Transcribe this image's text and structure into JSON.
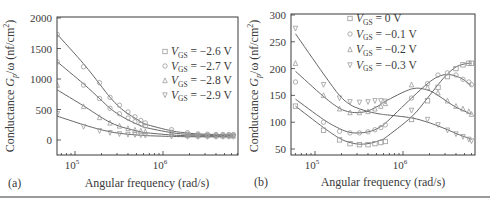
{
  "chart_data": [
    {
      "panel": "(a)",
      "type": "scatter",
      "title": "",
      "xlabel": "Angular frequency (rad/s)",
      "ylabel": "Conductance Gp/ω (nF/cm²)",
      "xscale": "log",
      "xlim": [
        63000,
        7000000
      ],
      "ylim": [
        -250,
        2000
      ],
      "xticks": [
        "10^5",
        "10^6"
      ],
      "yticks": [
        0,
        500,
        1000,
        1500,
        2000
      ],
      "legend": [
        "VGS = −2.6 V",
        "VGS = −2.7 V",
        "VGS = −2.8 V",
        "VGS = −2.9 V"
      ],
      "legend_position": "upper right",
      "grid": false,
      "series": [
        {
          "name": "VGS = −2.6 V",
          "marker": "circle",
          "x": [
            63000,
            125000,
            190000,
            250000,
            320000,
            400000,
            480000,
            560000,
            630000,
            1250000,
            1900000,
            2500000,
            3200000,
            4000000,
            4800000,
            5600000,
            6300000
          ],
          "y": [
            1730,
            1200,
            940,
            700,
            570,
            460,
            380,
            320,
            280,
            170,
            120,
            100,
            95,
            90,
            90,
            90,
            90
          ],
          "fit_y": [
            1730,
            1250,
            920,
            700,
            540,
            430,
            360,
            300,
            260,
            150,
            115,
            100,
            95,
            90,
            88,
            88,
            88
          ]
        },
        {
          "name": "VGS = −2.7 V",
          "marker": "circle",
          "x": [
            63000,
            125000,
            190000,
            250000,
            320000,
            400000,
            480000,
            560000,
            630000,
            1250000,
            1900000,
            2500000,
            3200000,
            4000000,
            4800000,
            5600000,
            6300000
          ],
          "y": [
            1280,
            900,
            680,
            520,
            430,
            360,
            300,
            260,
            230,
            130,
            95,
            85,
            80,
            80,
            80,
            80,
            80
          ],
          "fit_y": [
            1280,
            920,
            680,
            520,
            410,
            330,
            275,
            235,
            205,
            120,
            92,
            82,
            78,
            76,
            75,
            75,
            75
          ]
        },
        {
          "name": "VGS = −2.8 V",
          "marker": "triangle-up",
          "x": [
            63000,
            125000,
            190000,
            250000,
            320000,
            400000,
            480000,
            560000,
            630000,
            1250000,
            1900000,
            2500000,
            3200000,
            4000000,
            4800000,
            5600000,
            6300000
          ],
          "y": [
            900,
            550,
            370,
            280,
            230,
            190,
            165,
            150,
            135,
            90,
            75,
            70,
            70,
            68,
            68,
            68,
            68
          ],
          "fit_y": [
            820,
            560,
            390,
            290,
            225,
            185,
            155,
            135,
            120,
            82,
            70,
            66,
            65,
            64,
            64,
            64,
            64
          ]
        },
        {
          "name": "VGS = −2.9 V",
          "marker": "triangle-down",
          "x": [
            63000,
            125000,
            190000,
            250000,
            320000,
            400000,
            480000,
            560000,
            630000,
            1250000,
            1900000,
            2500000,
            3200000,
            4000000,
            4800000,
            5600000,
            6300000
          ],
          "y": [
            430,
            220,
            150,
            120,
            100,
            90,
            85,
            80,
            75,
            60,
            55,
            55,
            55,
            55,
            55,
            55,
            55
          ],
          "fit_y": [
            390,
            250,
            175,
            135,
            110,
            95,
            85,
            78,
            72,
            58,
            54,
            53,
            52,
            52,
            52,
            52,
            52
          ]
        }
      ]
    },
    {
      "panel": "(b)",
      "type": "scatter",
      "title": "",
      "xlabel": "Angular frequency (rad/s)",
      "ylabel": "Conductance Gp/ω (nF/cm²)",
      "xscale": "log",
      "xlim": [
        54000,
        6600000
      ],
      "ylim": [
        45,
        300
      ],
      "xticks": [
        "10^5",
        "10^6"
      ],
      "yticks": [
        50,
        100,
        150,
        200,
        250,
        300
      ],
      "legend": [
        "VGS = 0 V",
        "VGS = −0.1 V",
        "VGS = −0.2 V",
        "VGS = −0.3 V"
      ],
      "legend_position": "upper center",
      "grid": false,
      "series": [
        {
          "name": "VGS = 0 V",
          "marker": "square",
          "x": [
            60000,
            125000,
            190000,
            250000,
            320000,
            400000,
            480000,
            560000,
            630000,
            1250000,
            1900000,
            2500000,
            3200000,
            4000000,
            4800000,
            5600000,
            6000000
          ],
          "y": [
            130,
            85,
            67,
            60,
            58,
            58,
            60,
            62,
            64,
            105,
            140,
            165,
            185,
            200,
            207,
            210,
            210
          ],
          "fit_y": [
            130,
            90,
            70,
            62,
            59,
            60,
            63,
            67,
            71,
            110,
            145,
            170,
            190,
            203,
            208,
            210,
            210
          ]
        },
        {
          "name": "VGS = −0.1 V",
          "marker": "circle",
          "x": [
            60000,
            125000,
            190000,
            250000,
            320000,
            400000,
            480000,
            560000,
            630000,
            1250000,
            1900000,
            2500000,
            3200000,
            4000000,
            4800000,
            5600000,
            6000000
          ],
          "y": [
            175,
            100,
            83,
            80,
            80,
            82,
            86,
            90,
            95,
            145,
            172,
            188,
            192,
            188,
            180,
            175,
            170
          ],
          "fit_y": [
            143,
            105,
            88,
            81,
            80,
            82,
            86,
            92,
            98,
            145,
            172,
            185,
            189,
            186,
            180,
            172,
            168
          ]
        },
        {
          "name": "VGS = −0.2 V",
          "marker": "triangle-up",
          "x": [
            60000,
            125000,
            190000,
            250000,
            320000,
            400000,
            480000,
            560000,
            630000,
            1250000,
            1900000,
            2500000,
            3200000,
            4000000,
            4800000,
            5600000,
            6000000
          ],
          "y": [
            210,
            150,
            125,
            118,
            118,
            120,
            125,
            130,
            135,
            170,
            165,
            155,
            140,
            130,
            125,
            120,
            115
          ],
          "fit_y": [
            195,
            148,
            126,
            119,
            118,
            121,
            127,
            133,
            139,
            162,
            160,
            150,
            138,
            128,
            122,
            117,
            115
          ]
        },
        {
          "name": "VGS = −0.3 V",
          "marker": "triangle-down",
          "x": [
            60000,
            125000,
            190000,
            250000,
            320000,
            400000,
            480000,
            560000,
            630000,
            1250000,
            1900000,
            2500000,
            3200000,
            4000000,
            4800000,
            5600000,
            6000000
          ],
          "y": [
            275,
            170,
            145,
            138,
            137,
            138,
            140,
            140,
            139,
            122,
            105,
            95,
            85,
            78,
            73,
            68,
            65
          ],
          "fit_y": [
            265,
            190,
            150,
            133,
            125,
            120,
            117,
            115,
            114,
            108,
            100,
            93,
            86,
            79,
            74,
            70,
            68
          ]
        }
      ]
    }
  ],
  "panels": {
    "a": {
      "label": "(a)",
      "xlabel": "Angular frequency (rad/s)",
      "ylabel_prefix": "Conductance ",
      "ylabel_var": "G",
      "ylabel_sub": "p",
      "ylabel_suffix": "/ω (nf/cm",
      "ylabel_sup": "2",
      "ylabel_close": ")",
      "yticks": [
        "2000",
        "1500",
        "1000",
        "500",
        "0"
      ],
      "xtick_base": "10",
      "xticks_exp": [
        "5",
        "6"
      ],
      "legend": [
        {
          "var": "V",
          "sub": "GS",
          "rest": " = −2.6 V",
          "marker": "square"
        },
        {
          "var": "V",
          "sub": "GS",
          "rest": " = −2.7 V",
          "marker": "circle"
        },
        {
          "var": "V",
          "sub": "GS",
          "rest": " = −2.8 V",
          "marker": "triangle-up"
        },
        {
          "var": "V",
          "sub": "GS",
          "rest": " = −2.9 V",
          "marker": "triangle-down"
        }
      ]
    },
    "b": {
      "label": "(b)",
      "xlabel": "Angular frequency (rad/s)",
      "ylabel_prefix": "Conductance ",
      "ylabel_var": "G",
      "ylabel_sub": "p",
      "ylabel_suffix": "/ω (nf/cm",
      "ylabel_sup": "2",
      "ylabel_close": ")",
      "yticks": [
        "300",
        "250",
        "200",
        "150",
        "100",
        "50"
      ],
      "xtick_base": "10",
      "xticks_exp": [
        "5",
        "6"
      ],
      "legend": [
        {
          "var": "V",
          "sub": "GS",
          "rest": " = 0 V",
          "marker": "square"
        },
        {
          "var": "V",
          "sub": "GS",
          "rest": " = −0.1 V",
          "marker": "circle"
        },
        {
          "var": "V",
          "sub": "GS",
          "rest": " = −0.2 V",
          "marker": "triangle-up"
        },
        {
          "var": "V",
          "sub": "GS",
          "rest": " = −0.3 V",
          "marker": "triangle-down"
        }
      ]
    }
  },
  "colors": {
    "axis": "#3a3a3a",
    "curve": "#555555",
    "marker": "#9a9a9a"
  }
}
